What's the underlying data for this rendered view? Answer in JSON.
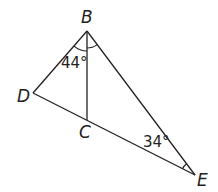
{
  "diagram": {
    "type": "geometry",
    "colors": {
      "stroke": "#231f20",
      "background": "#ffffff"
    },
    "points": {
      "B": {
        "label": "B",
        "x": 87,
        "y": 31
      },
      "D": {
        "label": "D",
        "x": 33,
        "y": 93
      },
      "C": {
        "label": "C",
        "x": 87,
        "y": 120
      },
      "E": {
        "label": "E",
        "x": 195,
        "y": 175
      }
    },
    "segments": [
      {
        "from": "B",
        "to": "D"
      },
      {
        "from": "B",
        "to": "E"
      },
      {
        "from": "D",
        "to": "E"
      },
      {
        "from": "B",
        "to": "C"
      }
    ],
    "angles": [
      {
        "vertex": "B",
        "between": [
          "D",
          "C"
        ],
        "value": "44°",
        "marker": "single-arc"
      },
      {
        "vertex": "B",
        "between": [
          "C",
          "E"
        ],
        "value": "",
        "marker": "single-arc"
      },
      {
        "vertex": "E",
        "between": [
          "B",
          "D"
        ],
        "value": "34°",
        "marker": "single-arc"
      }
    ],
    "labels": {
      "B": "B",
      "C": "C",
      "D": "D",
      "E": "E",
      "angle_DBC": "44°",
      "angle_BED": "34°"
    }
  }
}
